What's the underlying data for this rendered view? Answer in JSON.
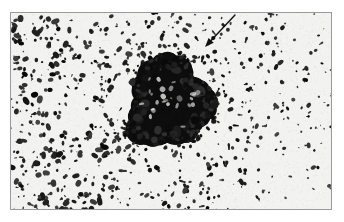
{
  "figure": {
    "domain_description": "photomicrograph",
    "width": 344,
    "height": 222,
    "background_color": "#ffffff",
    "plate": {
      "name": "micrograph-plate",
      "x": 10,
      "y": 12,
      "width": 322,
      "height": 198,
      "border_color": "#9a9a9a",
      "border_width": 1,
      "field_color": "#f2f2f0",
      "particle_color": "#1a1a1a"
    },
    "specimen_field": {
      "description": "speckled field of small dark irregular particles on a light gray background",
      "particle_count": 1150,
      "particle_min_size": 1.0,
      "particle_max_size": 4.6,
      "density_gradient": "denser toward the left half, sparser toward the right half",
      "density_left": 1.0,
      "density_right": 0.34
    },
    "colony": {
      "name": "dense-particle-cluster",
      "center_x": 158,
      "center_y": 90,
      "core_radius": 33,
      "fringe_radius": 50,
      "fill_color": "#0d0d0d",
      "edge": "ragged",
      "satellite_count": 420
    },
    "annotation_arrow": {
      "name": "pointer-arrow",
      "tail_x": 224,
      "tail_y": 2,
      "head_x": 194,
      "head_y": 34,
      "color": "#111111",
      "line_width": 1.4,
      "head_length": 9,
      "head_width": 7
    }
  },
  "labels": {
    "figure_title": "",
    "scale_bar": "",
    "caption": ""
  }
}
